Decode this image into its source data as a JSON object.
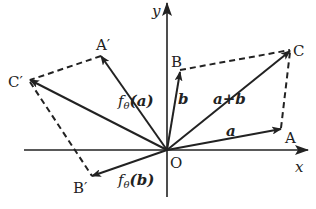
{
  "diagram": {
    "type": "vector-rotation",
    "colors": {
      "stroke": "#222222",
      "background": "#ffffff"
    },
    "axes": {
      "x_label": "x",
      "y_label": "y",
      "origin_label": "O"
    },
    "points": {
      "A": "A",
      "B": "B",
      "C": "C",
      "A_prime": "A′",
      "B_prime": "B′",
      "C_prime": "C′"
    },
    "vectors": {
      "a": "a",
      "b": "b",
      "a_plus_b": "a+b",
      "f_a_prefix": "f",
      "f_sub": "θ",
      "f_a_arg": "(a)",
      "f_b_arg": "(b)"
    },
    "dashed_edges": [
      "B–C",
      "A–C",
      "A′–C′",
      "B′–C′"
    ]
  }
}
